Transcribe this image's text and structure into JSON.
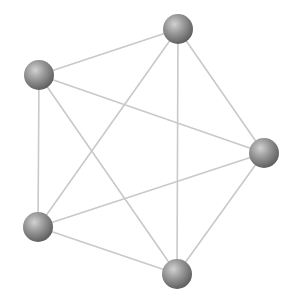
{
  "diagram": {
    "type": "complete-graph",
    "name": "K5",
    "width": 300,
    "height": 304,
    "colors": {
      "background": "#ffffff",
      "edge": "#c9c9c9",
      "node_highlight": "#d2d2d2",
      "node_mid": "#9a9a9a",
      "node_shadow": "#5e5e5e"
    },
    "node_radius": 15,
    "nodes": [
      {
        "id": "n1",
        "position": "top",
        "x": 178,
        "y": 29
      },
      {
        "id": "n2",
        "position": "upper-left",
        "x": 39,
        "y": 75
      },
      {
        "id": "n3",
        "position": "right",
        "x": 264,
        "y": 153
      },
      {
        "id": "n4",
        "position": "lower-left",
        "x": 38,
        "y": 227
      },
      {
        "id": "n5",
        "position": "bottom",
        "x": 177,
        "y": 274
      }
    ],
    "edges": [
      [
        "n1",
        "n2"
      ],
      [
        "n1",
        "n3"
      ],
      [
        "n1",
        "n4"
      ],
      [
        "n1",
        "n5"
      ],
      [
        "n2",
        "n3"
      ],
      [
        "n2",
        "n4"
      ],
      [
        "n2",
        "n5"
      ],
      [
        "n3",
        "n4"
      ],
      [
        "n3",
        "n5"
      ],
      [
        "n4",
        "n5"
      ]
    ]
  }
}
